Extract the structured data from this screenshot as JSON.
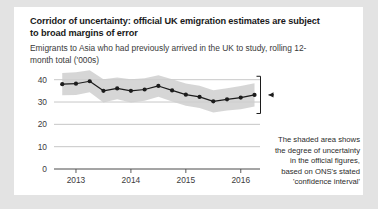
{
  "card": {
    "title": "Corridor of uncertainty: official UK emigration estimates are subject to broad margins of error",
    "subtitle": "Emigrants to Asia who had previously arrived in the UK to study, rolling 12-month total ('000s)"
  },
  "annotation": {
    "lines": [
      "The shaded area shows",
      "the degree of uncertainty",
      "in the official figures,",
      "based on ONS's stated",
      "'confidence interval'"
    ]
  },
  "colors": {
    "page_background": "#e3e3e3",
    "card_background": "#ffffff",
    "line": "#1c1c1c",
    "band": "#cfcfcf",
    "grid": "#b9b9b9",
    "axis": "#4a4a4a",
    "text": "#1a1a1a"
  },
  "chart_data": {
    "type": "line",
    "title": "Corridor of uncertainty: official UK emigration estimates are subject to broad margins of error",
    "subtitle": "Emigrants to Asia who had previously arrived in the UK to study, rolling 12-month total ('000s)",
    "xlabel": "",
    "ylabel": "",
    "ylim": [
      0,
      43
    ],
    "yticks": [
      0,
      10,
      20,
      30,
      40
    ],
    "ytick_labels": [
      "0",
      "10",
      "20",
      "30",
      "40"
    ],
    "xlim": [
      2012.6,
      2016.35
    ],
    "xticks": [
      2013,
      2014,
      2015,
      2016
    ],
    "xtick_labels": [
      "2013",
      "2014",
      "2015",
      "2016"
    ],
    "grid": "horizontal",
    "legend": "none",
    "markers": true,
    "x": [
      2012.75,
      2013.0,
      2013.25,
      2013.5,
      2013.75,
      2014.0,
      2014.25,
      2014.5,
      2014.75,
      2015.0,
      2015.25,
      2015.5,
      2015.75,
      2016.0,
      2016.25
    ],
    "series": [
      {
        "name": "Emigrants to Asia who had previously arrived to study",
        "values": [
          38.0,
          38.2,
          39.3,
          35.0,
          36.1,
          35.0,
          35.6,
          37.2,
          35.2,
          33.3,
          32.3,
          30.3,
          31.2,
          32.0,
          33.2
        ]
      },
      {
        "name": "Confidence interval upper bound",
        "values": [
          43.0,
          43.3,
          44.2,
          40.2,
          41.0,
          40.2,
          40.6,
          42.0,
          40.2,
          38.3,
          37.3,
          35.3,
          36.2,
          37.2,
          38.4
        ]
      },
      {
        "name": "Confidence interval lower bound",
        "values": [
          33.0,
          33.1,
          34.4,
          29.8,
          31.2,
          29.8,
          30.6,
          32.4,
          30.2,
          28.3,
          27.3,
          25.3,
          26.2,
          26.8,
          28.0
        ]
      }
    ],
    "annotation_text": "The shaded area shows the degree of uncertainty in the official figures, based on ONS's stated 'confidence interval'",
    "annotation_marker": "bracket-with-left-arrow-at-series-end"
  }
}
